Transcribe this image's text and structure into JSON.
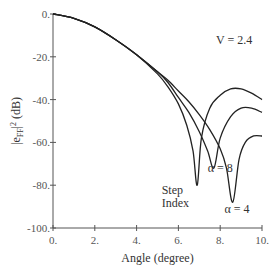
{
  "chart_data": {
    "type": "line",
    "title": "",
    "xlabel": "Angle (degree)",
    "ylabel": "|e_FF|^2 (dB)",
    "xlim": [
      0,
      10
    ],
    "ylim": [
      -100,
      0
    ],
    "xticks": [
      "0.",
      "2.",
      "4.",
      "6.",
      "8.",
      "10."
    ],
    "xtick_values": [
      0,
      2,
      4,
      6,
      8,
      10
    ],
    "yticks": [
      "0.",
      "-20.",
      "-40.",
      "-60.",
      "-80.",
      "-100."
    ],
    "ytick_values": [
      0,
      -20,
      -40,
      -60,
      -80,
      -100
    ],
    "grid": false,
    "annotations": [
      {
        "text": "V = 2.4",
        "x": 7.8,
        "y": -14
      },
      {
        "text": "α = 8",
        "x": 7.4,
        "y": -74
      },
      {
        "text": "Step",
        "x": 5.2,
        "y": -84
      },
      {
        "text": "Index",
        "x": 5.2,
        "y": -90
      },
      {
        "text": "α = 4",
        "x": 8.2,
        "y": -93
      }
    ],
    "series": [
      {
        "name": "Step Index",
        "x": [
          0,
          1,
          2,
          3,
          4,
          5,
          5.5,
          6,
          6.4,
          6.7,
          6.9,
          7.1,
          7.5,
          8,
          8.5,
          9,
          9.5,
          10
        ],
        "y": [
          0,
          -2,
          -6,
          -12,
          -19,
          -28,
          -34,
          -42,
          -52,
          -64,
          -80,
          -58,
          -44,
          -38,
          -35,
          -35,
          -37,
          -40
        ]
      },
      {
        "name": "α = 8",
        "x": [
          0,
          1,
          2,
          3,
          4,
          5,
          5.5,
          6,
          6.5,
          7,
          7.4,
          7.7,
          8,
          8.5,
          9,
          9.5,
          10
        ],
        "y": [
          0,
          -2,
          -6,
          -12,
          -19,
          -27,
          -32,
          -39,
          -46,
          -55,
          -64,
          -72,
          -58,
          -48,
          -44,
          -44,
          -46
        ]
      },
      {
        "name": "α = 4",
        "x": [
          0,
          1,
          2,
          3,
          4,
          5,
          5.5,
          6,
          6.5,
          7,
          7.5,
          8,
          8.3,
          8.6,
          8.9,
          9.2,
          9.6,
          10
        ],
        "y": [
          0,
          -2,
          -6,
          -12,
          -19,
          -27,
          -31,
          -36,
          -41,
          -47,
          -54,
          -63,
          -72,
          -88,
          -68,
          -60,
          -57,
          -57
        ]
      }
    ]
  }
}
